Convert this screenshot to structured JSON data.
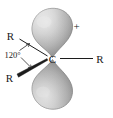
{
  "figure": {
    "name": "carbocation-p-orbital-diagram",
    "background_color": "#ffffff",
    "center_atom": "C",
    "charge": "+",
    "angle": "120°",
    "substituents": {
      "upper_left": "R",
      "lower_left": "R",
      "right": "R"
    },
    "orbital": {
      "type": "p-orbital",
      "lobes": 2,
      "fill_light": "#d4d4d4",
      "fill_mid": "#b0b0b0",
      "fill_dark": "#8a8a8a",
      "outline": "#6e6e6e"
    },
    "bonds": {
      "upper_left_style": "plain-line",
      "lower_left_style": "bold-wedge",
      "right_style": "plain-line"
    }
  }
}
